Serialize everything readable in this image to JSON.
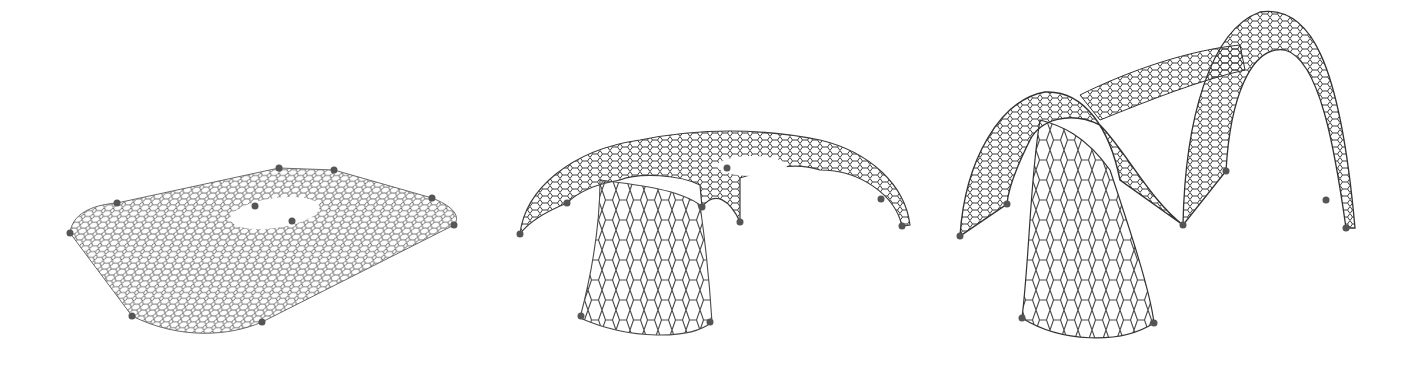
{
  "figures": [
    {
      "id": "flat-mesh",
      "label": "Flat hexagonal mesh with opening",
      "anchor_points": [
        [
          70,
          233
        ],
        [
          117,
          203
        ],
        [
          279,
          168
        ],
        [
          334,
          170
        ],
        [
          255,
          206
        ],
        [
          292,
          221
        ],
        [
          432,
          198
        ],
        [
          454,
          225
        ],
        [
          132,
          316
        ],
        [
          262,
          322
        ]
      ]
    },
    {
      "id": "single-dome-gridshell",
      "label": "Single-support gridshell canopy",
      "anchor_points": [
        [
          520,
          234
        ],
        [
          567,
          203
        ],
        [
          727,
          168
        ],
        [
          702,
          207
        ],
        [
          740,
          222
        ],
        [
          881,
          199
        ],
        [
          902,
          226
        ],
        [
          581,
          316
        ],
        [
          710,
          322
        ]
      ]
    },
    {
      "id": "double-arch-gridshell",
      "label": "Double-arch gridshell",
      "anchor_points": [
        [
          960,
          236
        ],
        [
          1007,
          204
        ],
        [
          1226,
          171
        ],
        [
          1183,
          225
        ],
        [
          1326,
          200
        ],
        [
          1346,
          228
        ],
        [
          1022,
          318
        ],
        [
          1154,
          323
        ]
      ]
    }
  ],
  "colors": {
    "background": "#ffffff",
    "mesh": "#4a4a4a",
    "anchor": "#555555"
  }
}
